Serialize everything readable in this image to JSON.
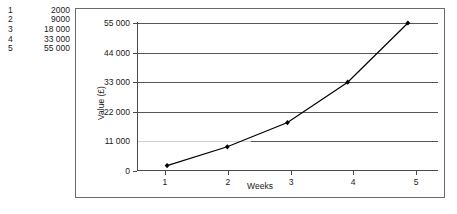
{
  "chart_data": {
    "type": "line",
    "title": "",
    "xlabel": "Weeks",
    "ylabel": "Value (£)",
    "x": [
      1,
      2,
      3,
      4,
      5
    ],
    "values": [
      2000,
      9000,
      18000,
      33000,
      55000
    ],
    "series": [
      {
        "name": "Value",
        "values": [
          2000,
          9000,
          18000,
          33000,
          55000
        ]
      }
    ],
    "categories": [
      "1",
      "2",
      "3",
      "4",
      "5"
    ],
    "xlim": [
      0.5,
      5.5
    ],
    "ylim": [
      0,
      55000
    ],
    "x_tick_labels": [
      "1",
      "2",
      "3",
      "4",
      "5"
    ],
    "y_tick_labels": [
      "0",
      "11 000",
      "22 000",
      "33 000",
      "44 000",
      "55 000"
    ],
    "y_ticks": [
      0,
      11000,
      22000,
      33000,
      44000,
      55000
    ],
    "grid": true,
    "legend": false,
    "marker": "diamond",
    "line_color": "#000000",
    "grid_color": "#555555"
  },
  "data_table": {
    "rows": [
      {
        "index": "1",
        "value": "2000"
      },
      {
        "index": "2",
        "value": "9000"
      },
      {
        "index": "3",
        "value": "18 000"
      },
      {
        "index": "4",
        "value": "33 000"
      },
      {
        "index": "5",
        "value": "55 000"
      }
    ]
  },
  "axis": {
    "y_title": "Value (£)",
    "x_title": "Weeks",
    "y_labels": {
      "t0": "0",
      "t1": "11 000",
      "t2": "22 000",
      "t3": "33 000",
      "t4": "44 000",
      "t5": "55 000"
    },
    "x_labels": {
      "t1": "1",
      "t2": "2",
      "t3": "3",
      "t4": "4",
      "t5": "5"
    }
  }
}
